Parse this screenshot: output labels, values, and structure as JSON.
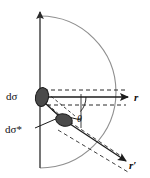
{
  "figure": {
    "kind": "scattering-geometry-diagram",
    "background_color": "#ffffff",
    "width": 150,
    "height": 178
  },
  "labels": {
    "dsigma": "dσ",
    "dsigma_star": "dσ*",
    "r": "r",
    "r_prime": "r′",
    "theta": "θ"
  },
  "colors": {
    "axis": "#3b3b3b",
    "arc": "#8a8a8a",
    "patch_fill": "#4a4a4a",
    "patch_stroke": "#1c1c1c",
    "dashed": "#2a2a2a",
    "solid_ray": "#1c1c1c",
    "text": "#111111"
  },
  "geometry": {
    "vertical_axis": {
      "x": 40,
      "y_top": 8,
      "y_bottom": 168
    },
    "arc": {
      "center_x": 40,
      "center_y": 92,
      "radius": 76
    },
    "patch_dsigma": {
      "cx": 42,
      "cy": 97,
      "rx": 6.5,
      "ry": 9.5,
      "rotation": 10
    },
    "patch_dsigma_star": {
      "cx": 64,
      "cy": 120,
      "rx": 8.5,
      "ry": 6,
      "rotation": 18
    },
    "ray_r": {
      "x1": 42,
      "y1": 97,
      "x2": 131,
      "y2": 97
    },
    "ray_r_prime": {
      "x1": 64,
      "y1": 120,
      "x2": 130,
      "y2": 163
    },
    "theta_arc_radius": 22,
    "dashed_horizontal_upper_y": 90,
    "dashed_horizontal_lower_y": 105
  }
}
